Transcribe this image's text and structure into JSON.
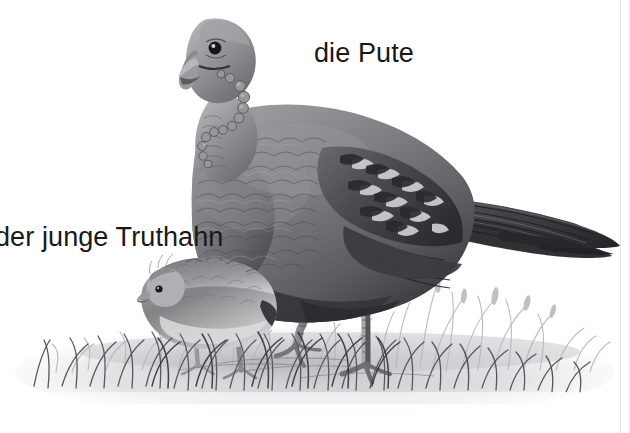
{
  "page": {
    "width": 630,
    "height": 433,
    "background_color": "#ffffff",
    "style": "grayscale pencil / wash illustration",
    "language": "German"
  },
  "labels": {
    "adult": {
      "text": "die Pute",
      "meaning": "the hen turkey",
      "x": 314,
      "y": 40,
      "font_size_px": 27,
      "color": "#18181a"
    },
    "chick": {
      "text": "der junge Truthahn",
      "meaning": "the young turkey",
      "x": -5,
      "y": 224,
      "font_size_px": 27,
      "color": "#18181a",
      "clipped_at_left_edge": true
    }
  },
  "scene": {
    "elements": [
      {
        "name": "adult-turkey",
        "description": "large turkey facing left, head with snood wattle and caruncles, barred wing and long pointed tail extending to the right edge"
      },
      {
        "name": "turkey-chick",
        "description": "small downy turkey poult facing left, standing in grass at lower left"
      },
      {
        "name": "grass-tuft",
        "description": "tufts of grass with seed heads across the lower third"
      },
      {
        "name": "ground-shadow",
        "description": "soft grey wash of ground fading to white"
      }
    ]
  },
  "colors": {
    "background": "#ffffff",
    "ink_dark": "#2b2b2d",
    "ink_mid": "#6e6e72",
    "ink_light": "#aeaeb2",
    "wash_pale": "#d8d8dc",
    "text": "#18181a",
    "border": "#e6e6e8"
  }
}
